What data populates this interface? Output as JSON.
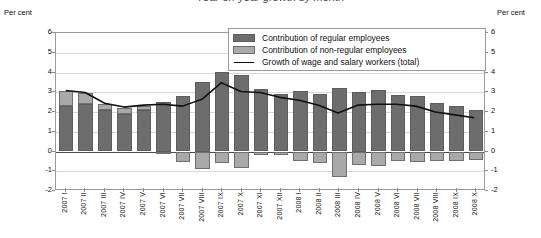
{
  "title": "Year-on-year growth by month",
  "axis": {
    "unit_label_left": "Per cent",
    "unit_label_right": "Per cent",
    "y_ticks": [
      "6",
      "5",
      "4",
      "3",
      "2",
      "1",
      "0",
      "-1",
      "-2"
    ]
  },
  "legend": {
    "items": [
      {
        "label": "Contribution of regular employees",
        "swatch": "regular",
        "color": "#6d6d6d"
      },
      {
        "label": "Contribution of non-regular employees",
        "swatch": "nonregular",
        "color": "#a9a9a9"
      },
      {
        "label": "Growth of wage and salary workers (total)",
        "swatch": "line",
        "color": "#111111"
      }
    ]
  },
  "chart_data": {
    "type": "bar",
    "title": "Year-on-year growth by month",
    "xlabel": "",
    "ylabel": "Per cent",
    "ylim": [
      -2,
      6
    ],
    "grid": true,
    "legend_position": "top-right",
    "categories": [
      "2007 I",
      "2007 II",
      "2007 III",
      "2007 IV",
      "2007 V",
      "2007 VI",
      "2007 VII",
      "2007 VIII",
      "2007 IX",
      "2007 X",
      "2007 XI",
      "2007 XII",
      "2008 I",
      "2008 II",
      "2008 III",
      "2008 IV",
      "2008 V",
      "2008 VI",
      "2008 VII",
      "2008 VIII",
      "2008 IX",
      "2008 X"
    ],
    "series": [
      {
        "name": "Contribution of regular employees",
        "type": "bar-stacked",
        "color": "#6d6d6d",
        "values": [
          2.3,
          2.4,
          2.1,
          1.9,
          2.1,
          2.5,
          2.8,
          3.5,
          4.05,
          3.85,
          3.15,
          2.9,
          3.05,
          2.9,
          3.2,
          3.0,
          3.1,
          2.85,
          2.8,
          2.45,
          2.3,
          2.1
        ]
      },
      {
        "name": "Contribution of non-regular employees",
        "type": "bar-stacked",
        "color": "#a9a9a9",
        "values": [
          0.75,
          0.55,
          0.3,
          0.3,
          0.2,
          -0.15,
          -0.55,
          -0.9,
          -0.6,
          -0.85,
          -0.2,
          -0.2,
          -0.5,
          -0.6,
          -1.3,
          -0.7,
          -0.75,
          -0.5,
          -0.55,
          -0.5,
          -0.5,
          -0.45
        ]
      },
      {
        "name": "Growth of wage and salary workers (total)",
        "type": "line",
        "color": "#111111",
        "values": [
          3.05,
          2.95,
          2.4,
          2.2,
          2.3,
          2.35,
          2.25,
          2.6,
          3.45,
          3.0,
          2.95,
          2.7,
          2.55,
          2.3,
          1.9,
          2.3,
          2.35,
          2.35,
          2.25,
          1.95,
          1.8,
          1.65
        ]
      }
    ]
  }
}
